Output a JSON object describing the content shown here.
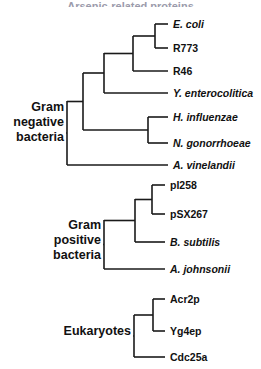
{
  "figure": {
    "title_clipped": "Arsenic-related proteins",
    "background_color": "#ffffff",
    "line_color": "#1a1a1a",
    "text_color": "#111111"
  },
  "chart_data": {
    "type": "tree",
    "title": "",
    "xlabel": "",
    "ylabel": "",
    "layout": "rectangular-cladogram-left-to-right",
    "groups": [
      {
        "id": "gram-negative",
        "label_lines": [
          "Gram",
          "negative",
          "bacteria"
        ],
        "label_x": 64,
        "label_y": 123,
        "root_x": 67,
        "leaves": [
          {
            "name": "E. coli",
            "italic": true,
            "x_tip": 168,
            "y": 24
          },
          {
            "name": "R773",
            "italic": false,
            "x_tip": 168,
            "y": 48
          },
          {
            "name": "R46",
            "italic": false,
            "x_tip": 168,
            "y": 71
          },
          {
            "name": "Y. enterocolitica",
            "italic": true,
            "x_tip": 168,
            "y": 93
          },
          {
            "name": "H. influenzae",
            "italic": true,
            "x_tip": 168,
            "y": 117
          },
          {
            "name": "N. gonorrhoeae",
            "italic": true,
            "x_tip": 168,
            "y": 143
          },
          {
            "name": "A. vinelandii",
            "italic": true,
            "x_tip": 168,
            "y": 165
          }
        ],
        "nodes": [
          {
            "id": "n-ecoli-r773",
            "x": 155,
            "y_top": 24,
            "y_bottom": 48
          },
          {
            "id": "n-ecoli-r773-r46",
            "x": 133,
            "y_top": 36,
            "y_bottom": 71
          },
          {
            "id": "n-entero",
            "x": 104,
            "y_top": 53,
            "y_bottom": 93
          },
          {
            "id": "n-hinf-ngon",
            "x": 148,
            "y_top": 117,
            "y_bottom": 143
          },
          {
            "id": "n-proteo",
            "x": 83,
            "y_top": 73,
            "y_bottom": 130
          },
          {
            "id": "n-gramneg-root",
            "x": 67,
            "y_top": 101,
            "y_bottom": 165
          }
        ]
      },
      {
        "id": "gram-positive",
        "label_lines": [
          "Gram",
          "positive",
          "bacteria"
        ],
        "label_x": 101,
        "label_y": 241,
        "root_x": 104,
        "leaves": [
          {
            "name": "pI258",
            "italic": false,
            "x_tip": 165,
            "y": 185
          },
          {
            "name": "pSX267",
            "italic": false,
            "x_tip": 165,
            "y": 214
          },
          {
            "name": "B. subtilis",
            "italic": true,
            "x_tip": 165,
            "y": 242
          },
          {
            "name": "A. johnsonii",
            "italic": true,
            "x_tip": 165,
            "y": 269
          }
        ],
        "nodes": [
          {
            "id": "n-pi258-psx267",
            "x": 152,
            "y_top": 185,
            "y_bottom": 214
          },
          {
            "id": "n-plasmids-bsub",
            "x": 135,
            "y_top": 199,
            "y_bottom": 242
          },
          {
            "id": "n-grampos-root",
            "x": 104,
            "y_top": 220,
            "y_bottom": 269
          }
        ]
      },
      {
        "id": "eukaryotes",
        "label_lines": [
          "Eukaryotes"
        ],
        "label_x": 131,
        "label_y": 332,
        "root_x": 134,
        "leaves": [
          {
            "name": "Acr2p",
            "italic": false,
            "x_tip": 165,
            "y": 299
          },
          {
            "name": "Yg4ep",
            "italic": false,
            "x_tip": 165,
            "y": 331
          },
          {
            "name": "Cdc25a",
            "italic": false,
            "x_tip": 165,
            "y": 357
          }
        ],
        "nodes": [
          {
            "id": "n-acr2p-yg4ep",
            "x": 153,
            "y_top": 299,
            "y_bottom": 331
          },
          {
            "id": "n-euk-root",
            "x": 134,
            "y_top": 315,
            "y_bottom": 357
          }
        ]
      }
    ]
  }
}
